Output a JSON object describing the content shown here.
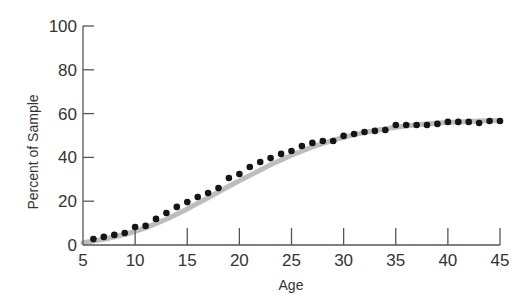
{
  "chart_data": {
    "type": "scatter",
    "title": "",
    "xlabel": "Age",
    "ylabel": "Percent of Sample",
    "xlim": [
      5,
      45
    ],
    "ylim": [
      0,
      100
    ],
    "x_ticks": [
      5,
      10,
      15,
      20,
      25,
      30,
      35,
      40,
      45
    ],
    "y_ticks": [
      0,
      20,
      40,
      60,
      80,
      100
    ],
    "grid": false,
    "legend": null,
    "series": [
      {
        "name": "Observed",
        "style": "points",
        "x": [
          6,
          7,
          8,
          9,
          10,
          11,
          12,
          13,
          14,
          15,
          16,
          17,
          18,
          19,
          20,
          21,
          22,
          23,
          24,
          25,
          26,
          27,
          28,
          29,
          30,
          31,
          32,
          33,
          34,
          35,
          36,
          37,
          38,
          39,
          40,
          41,
          42,
          43,
          44,
          45
        ],
        "values": [
          2.7,
          3.7,
          4.6,
          5.5,
          8.2,
          8.7,
          11.9,
          14.6,
          17.4,
          19.6,
          21.9,
          23.7,
          26.0,
          30.6,
          32.4,
          35.6,
          37.9,
          39.7,
          41.6,
          42.9,
          45.2,
          46.6,
          47.5,
          47.5,
          49.8,
          50.7,
          51.6,
          52.1,
          52.5,
          54.8,
          54.8,
          54.8,
          54.8,
          55.3,
          56.2,
          56.2,
          56.2,
          55.7,
          56.6,
          56.6
        ]
      },
      {
        "name": "Fitted curve",
        "style": "line",
        "x": [
          5,
          7,
          9,
          11,
          13,
          15,
          17,
          19,
          21,
          23,
          25,
          27,
          29,
          31,
          33,
          35,
          37,
          39,
          41,
          43,
          45
        ],
        "values": [
          1.0,
          2.6,
          4.8,
          7.8,
          11.8,
          16.5,
          21.6,
          26.8,
          31.8,
          36.6,
          41.0,
          44.8,
          47.9,
          50.4,
          52.3,
          53.8,
          54.9,
          55.7,
          56.2,
          56.6,
          56.9
        ]
      }
    ]
  },
  "colors": {
    "background": "#ffffff",
    "axis": "#555555",
    "points": "#151515",
    "curve": "#bdbdbd",
    "text": "#333333"
  }
}
